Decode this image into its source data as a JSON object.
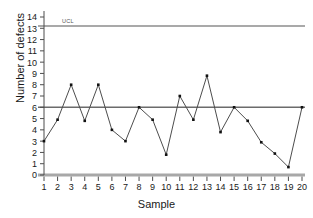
{
  "chart_data": {
    "type": "line",
    "title": "",
    "xlabel": "Sample",
    "ylabel": "Number of defects",
    "x": [
      1,
      2,
      3,
      4,
      5,
      6,
      7,
      8,
      9,
      10,
      11,
      12,
      13,
      14,
      15,
      16,
      17,
      18,
      19,
      20
    ],
    "values": [
      3.0,
      4.9,
      8.0,
      4.8,
      8.0,
      4.0,
      3.0,
      6.0,
      4.9,
      1.8,
      7.0,
      4.9,
      8.8,
      3.8,
      6.0,
      4.8,
      2.9,
      1.9,
      0.7,
      6.0
    ],
    "series": [
      {
        "name": "Number of defects",
        "values": [
          3.0,
          4.9,
          8.0,
          4.8,
          8.0,
          4.0,
          3.0,
          6.0,
          4.9,
          1.8,
          7.0,
          4.9,
          8.8,
          3.8,
          6.0,
          4.8,
          2.9,
          1.9,
          0.7,
          6.0
        ]
      }
    ],
    "xlim": [
      1,
      20
    ],
    "ylim": [
      0,
      14
    ],
    "ytick_labels": [
      "0",
      "1",
      "2",
      "3",
      "4",
      "5",
      "6",
      "7",
      "8",
      "9",
      "10",
      "11",
      "12",
      "13",
      "14"
    ],
    "xtick_labels": [
      "1",
      "2",
      "3",
      "4",
      "5",
      "6",
      "7",
      "8",
      "9",
      "10",
      "11",
      "12",
      "13",
      "14",
      "15",
      "16",
      "17",
      "18",
      "19",
      "20"
    ],
    "grid": false,
    "legend": "none",
    "annotations": [
      {
        "name": "ucl-label",
        "text": "UCL",
        "value": 13.2
      }
    ],
    "reference_lines": [
      {
        "name": "upper-control-limit",
        "label": "UCL",
        "value": 13.2,
        "color": "#8c8c8c"
      },
      {
        "name": "center-line",
        "label": "",
        "value": 6.0,
        "color": "#6b6b6b"
      },
      {
        "name": "lower-control-limit",
        "label": "",
        "value": 0.0,
        "color": "#a8a8a8"
      }
    ],
    "colors": {
      "line": "#4d4d4d",
      "marker": "#111111",
      "axis": "#4d4d4d",
      "background": "#ffffff"
    }
  }
}
